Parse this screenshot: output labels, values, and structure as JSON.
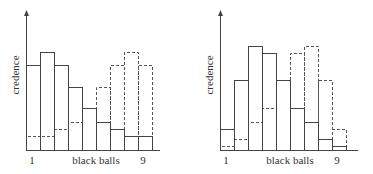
{
  "chart_data": [
    {
      "type": "bar",
      "title": "",
      "xlabel": "black balls",
      "ylabel": "credence",
      "categories": [
        "1",
        "2",
        "3",
        "4",
        "5",
        "6",
        "7",
        "8",
        "9"
      ],
      "tick_labels": {
        "first": "1",
        "last": "9"
      },
      "series": [
        {
          "name": "solid",
          "style": "solid",
          "values": [
            85,
            98,
            85,
            63,
            42,
            28,
            21,
            14,
            14
          ]
        },
        {
          "name": "dashed",
          "style": "dashed",
          "values": [
            14,
            14,
            21,
            28,
            42,
            63,
            85,
            98,
            85
          ]
        }
      ],
      "ylim": [
        0,
        140
      ],
      "grid": false,
      "legend": "none",
      "layout": {
        "axis_x": 26,
        "baseline_y": 150,
        "top_y": 10,
        "bar_start_x": 26,
        "bar_width": 14,
        "axis_end_x": 160,
        "ylabel_x": 16,
        "ylabel_y": 75,
        "label_y": 161,
        "tick1_x": 32,
        "tick9_x": 143,
        "xlabel_x": 96
      }
    },
    {
      "type": "bar",
      "title": "",
      "xlabel": "black balls",
      "ylabel": "credence",
      "categories": [
        "1",
        "2",
        "3",
        "4",
        "5",
        "6",
        "7",
        "8",
        "9"
      ],
      "tick_labels": {
        "first": "1",
        "last": "9"
      },
      "series": [
        {
          "name": "solid",
          "style": "solid",
          "values": [
            21,
            70,
            104,
            97,
            70,
            42,
            28,
            11,
            4
          ]
        },
        {
          "name": "dashed",
          "style": "dashed",
          "values": [
            4,
            11,
            28,
            42,
            70,
            97,
            104,
            70,
            21
          ]
        }
      ],
      "ylim": [
        0,
        140
      ],
      "grid": false,
      "legend": "none",
      "layout": {
        "axis_x": 220,
        "baseline_y": 150,
        "top_y": 10,
        "bar_start_x": 220,
        "bar_width": 14,
        "axis_end_x": 358,
        "ylabel_x": 210,
        "ylabel_y": 75,
        "label_y": 161,
        "tick1_x": 226,
        "tick9_x": 337,
        "xlabel_x": 290
      }
    }
  ],
  "colors": {
    "solid": "#444444",
    "dashed": "#555555",
    "axis": "#444444",
    "text": "#333333"
  }
}
